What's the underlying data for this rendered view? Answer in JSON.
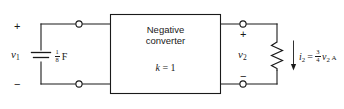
{
  "figure": {
    "type": "circuit-schematic",
    "background_color": "#ffffff",
    "line_color": "#1a1a1a",
    "text_color": "#1a1a1a"
  },
  "left_port": {
    "plus_sign": "+",
    "minus_sign": "−",
    "voltage_label": "v",
    "voltage_subscript": "1"
  },
  "capacitor": {
    "name": "capacitor",
    "value_numerator": "1",
    "value_denominator": "8",
    "unit": "F"
  },
  "center_box": {
    "title_line1": "Negative",
    "title_line2": "converter",
    "parameter_symbol": "k",
    "parameter_equals": "=",
    "parameter_value": "1"
  },
  "right_port": {
    "plus_sign": "+",
    "minus_sign": "−",
    "voltage_label": "v",
    "voltage_subscript": "2"
  },
  "resistor": {
    "name": "resistor",
    "current_label": "i",
    "current_subscript": "2",
    "equals": "=",
    "coefficient_numerator": "3",
    "coefficient_denominator": "4",
    "voltage_label": "v",
    "voltage_subscript": "2",
    "unit": "A"
  },
  "terminals": {
    "count": 4,
    "style": "open-circle"
  }
}
